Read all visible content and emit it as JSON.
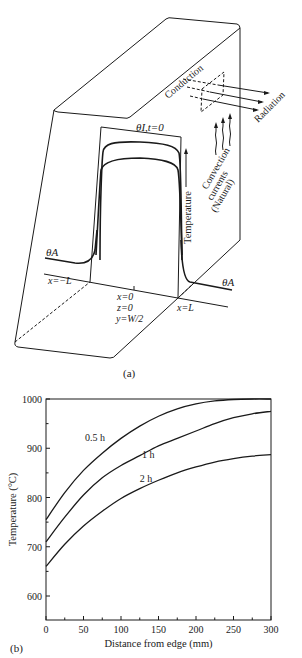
{
  "figure": {
    "panel_a": {
      "caption": "(a)",
      "labels": {
        "initial_temp": "θI,t=0",
        "ambient_left": "θA",
        "ambient_right": "θA",
        "x_minus_L": "x=−L",
        "x_zero": "x=0",
        "z_zero": "z=0",
        "y_half": "y=W/2",
        "x_plus_L": "x=L",
        "temperature_axis": "Temperature",
        "conduction": "Conduction",
        "radiation": "Radiation",
        "convection_1": "Convection",
        "convection_2": "currents",
        "convection_3": "(Natural)"
      }
    },
    "panel_b": {
      "caption": "(b)"
    }
  },
  "chart_data": {
    "type": "line",
    "title": "",
    "xlabel": "Distance from edge (mm)",
    "ylabel": "Temperature (°C)",
    "xlim": [
      0,
      300
    ],
    "ylim": [
      550,
      1000
    ],
    "xticks": [
      0,
      50,
      100,
      150,
      200,
      250,
      300
    ],
    "yticks": [
      600,
      700,
      800,
      900,
      1000
    ],
    "grid": false,
    "legend": "inline labels on curves",
    "x": [
      0,
      25,
      50,
      75,
      100,
      125,
      150,
      175,
      200,
      225,
      250,
      275,
      300
    ],
    "series": [
      {
        "name": "0.5 h",
        "values": [
          755,
          810,
          855,
          890,
          920,
          945,
          965,
          980,
          990,
          996,
          999,
          1000,
          1000
        ]
      },
      {
        "name": "1 h",
        "values": [
          710,
          760,
          805,
          840,
          865,
          885,
          905,
          920,
          935,
          950,
          962,
          970,
          975
        ]
      },
      {
        "name": "2 h",
        "values": [
          660,
          705,
          742,
          772,
          798,
          818,
          835,
          850,
          862,
          872,
          879,
          884,
          887
        ]
      }
    ]
  }
}
